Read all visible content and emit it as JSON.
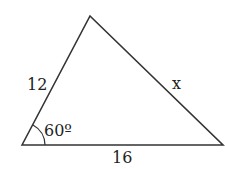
{
  "diagram": {
    "type": "triangle",
    "sides": {
      "left": "12",
      "right": "x",
      "base": "16"
    },
    "angle": {
      "vertex": "bottom-left",
      "label": "60º"
    },
    "colors": {
      "stroke": "#333333",
      "background": "#ffffff"
    }
  }
}
